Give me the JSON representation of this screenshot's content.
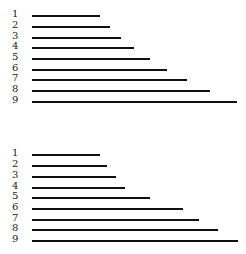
{
  "chart_data": [
    {
      "type": "bar",
      "title": "",
      "orientation": "horizontal",
      "categories": [
        "1",
        "2",
        "3",
        "4",
        "5",
        "6",
        "7",
        "8",
        "9"
      ],
      "values": [
        68,
        78,
        89,
        102,
        118,
        135,
        155,
        178,
        205
      ],
      "row_tops": [
        11,
        22,
        33,
        43,
        54,
        65,
        75,
        86,
        97
      ],
      "xlabel": "",
      "ylabel": ""
    },
    {
      "type": "bar",
      "title": "",
      "orientation": "horizontal",
      "categories": [
        "1",
        "2",
        "3",
        "4",
        "5",
        "6",
        "7",
        "8",
        "9"
      ],
      "values": [
        68,
        75,
        84,
        93,
        118,
        151,
        167,
        186,
        206
      ],
      "row_tops": [
        150,
        161,
        172,
        183,
        193,
        204,
        215,
        225,
        236
      ],
      "xlabel": "",
      "ylabel": ""
    }
  ]
}
